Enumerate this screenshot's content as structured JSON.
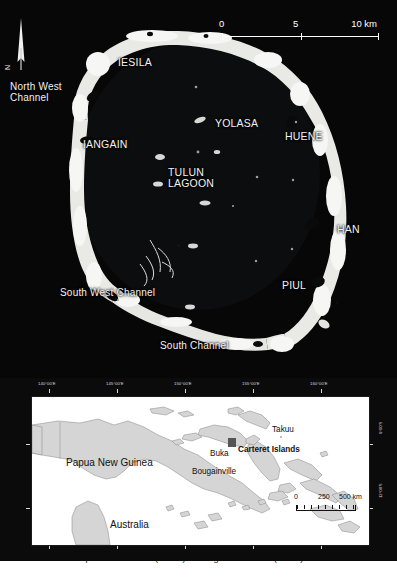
{
  "figure": {
    "caption_clipped": "Carteret Islands: Papua New Guinea (above) and regional location (below)"
  },
  "main_map": {
    "name": "Carteret Islands atoll satellite image",
    "background_color": "#070707",
    "reef_color": "#e9e9e6",
    "label_color": "#f2f2f2",
    "north_arrow": {
      "letter": "N"
    },
    "scale_bar": {
      "units": "km",
      "tick_0": "0",
      "tick_mid": "5",
      "tick_max": "10 km"
    },
    "labels": [
      {
        "id": "iesila",
        "text": "IESILA",
        "kind": "island",
        "x": 118,
        "y": 57
      },
      {
        "id": "north-west-channel",
        "text": "North West\nChannel",
        "kind": "channel",
        "x": 10,
        "y": 82
      },
      {
        "id": "iangain",
        "text": "IANGAIN",
        "kind": "island",
        "x": 83,
        "y": 139
      },
      {
        "id": "yolasa",
        "text": "YOLASA",
        "kind": "island",
        "x": 215,
        "y": 118
      },
      {
        "id": "huene",
        "text": "HUENE",
        "kind": "island",
        "x": 285,
        "y": 131
      },
      {
        "id": "tulun-lagoon",
        "text": "TULUN\nLAGOON",
        "kind": "lagoon",
        "x": 168,
        "y": 167
      },
      {
        "id": "han",
        "text": "HAN",
        "kind": "island",
        "x": 337,
        "y": 224
      },
      {
        "id": "piul",
        "text": "PIUL",
        "kind": "island",
        "x": 282,
        "y": 280
      },
      {
        "id": "south-west-channel",
        "text": "South West Channel",
        "kind": "channel",
        "x": 60,
        "y": 288
      },
      {
        "id": "south-channel",
        "text": "South Channel",
        "kind": "channel",
        "x": 160,
        "y": 341
      }
    ]
  },
  "inset_map": {
    "name": "Regional location map of Papua New Guinea and Solomon Sea",
    "land_color": "#d5d5d5",
    "sea_color": "#ffffff",
    "border_color": "#1a1a1a",
    "longitude_ticks": [
      {
        "label": "140°00'E",
        "x": 14
      },
      {
        "label": "145°00'E",
        "x": 82
      },
      {
        "label": "150°00'E",
        "x": 150
      },
      {
        "label": "155°00'E",
        "x": 218
      },
      {
        "label": "160°00'E",
        "x": 286
      }
    ],
    "latitude_ticks": [
      {
        "label": "6°00'S",
        "y": 49
      },
      {
        "label": "12°00'S",
        "y": 112
      }
    ],
    "labels": [
      {
        "id": "papua-new-guinea",
        "text": "Papua New Guinea",
        "kind": "country",
        "x": 34,
        "y": 64
      },
      {
        "id": "buka",
        "text": "Buka",
        "kind": "place",
        "x": 182,
        "y": 56
      },
      {
        "id": "bougainville",
        "text": "Bougainville",
        "kind": "place",
        "x": 164,
        "y": 74
      },
      {
        "id": "takuu",
        "text": "Takuu",
        "kind": "place",
        "x": 243,
        "y": 46
      },
      {
        "id": "carteret-islands",
        "text": "Carteret Islands",
        "kind": "bold",
        "x": 203,
        "y": 58
      },
      {
        "id": "australia",
        "text": "Australia",
        "kind": "country",
        "x": 78,
        "y": 125
      }
    ],
    "marker": {
      "id": "carteret-marker",
      "x": 200,
      "y": 45,
      "size": 7,
      "color": "#555555"
    },
    "scale_bar": {
      "units": "km",
      "tick_0": "0",
      "tick_mid": "250",
      "tick_max": "500 km"
    }
  }
}
